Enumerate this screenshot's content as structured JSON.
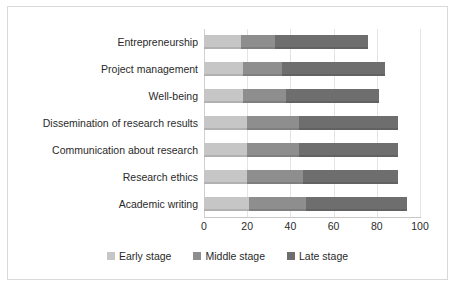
{
  "chart_data": {
    "type": "bar",
    "orientation": "horizontal",
    "stacked": true,
    "title": "",
    "subtitle": "",
    "xlabel": "",
    "ylabel": "",
    "xlim": [
      0,
      100
    ],
    "xticks": [
      0,
      20,
      40,
      60,
      80,
      100
    ],
    "xtick_labels": [
      "0",
      "20",
      "40",
      "60",
      "80",
      "100"
    ],
    "grid": true,
    "grid_axis": "x",
    "legend_position": "bottom",
    "categories": [
      "Entrepreneurship",
      "Project management",
      "Well-being",
      "Dissemination of research results",
      "Communication about research",
      "Research ethics",
      "Academic writing"
    ],
    "series": [
      {
        "name": "Early stage",
        "color": "#c6c6c6",
        "values": [
          17,
          18,
          18,
          20,
          20,
          20,
          21
        ]
      },
      {
        "name": "Middle stage",
        "color": "#8e8e8e",
        "values": [
          16,
          18,
          20,
          24,
          24,
          26,
          26
        ]
      },
      {
        "name": "Late stage",
        "color": "#6e6e6e",
        "values": [
          43,
          48,
          43,
          46,
          46,
          44,
          47
        ]
      }
    ],
    "cumulative_totals": [
      76,
      84,
      81,
      90,
      90,
      90,
      94
    ]
  },
  "legend": {
    "items": [
      {
        "label": "Early stage",
        "color": "#c6c6c6"
      },
      {
        "label": "Middle stage",
        "color": "#8e8e8e"
      },
      {
        "label": "Late stage",
        "color": "#6e6e6e"
      }
    ]
  },
  "colors": {
    "early": "#c6c6c6",
    "middle": "#8e8e8e",
    "late": "#6e6e6e",
    "grid": "#e4e4e4",
    "border": "#d9d9d9",
    "text": "#2a2a2a",
    "background": "#ffffff"
  }
}
